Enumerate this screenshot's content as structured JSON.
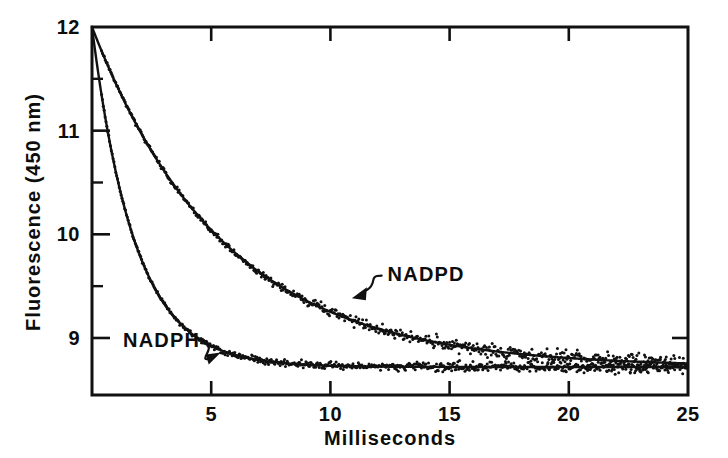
{
  "chart_data": {
    "type": "line",
    "title": "",
    "xlabel": "Milliseconds",
    "ylabel": "Fluorescence  (450 nm)",
    "xlim": [
      0,
      25
    ],
    "ylim": [
      8.45,
      12
    ],
    "grid": false,
    "legend_position": "inline-annotations",
    "x_ticks": [
      5,
      10,
      15,
      20,
      25
    ],
    "x_tick_labels": [
      "5",
      "10",
      "15",
      "20",
      "25"
    ],
    "x_minor_ticks": [],
    "y_ticks": [
      9,
      10,
      11,
      12
    ],
    "y_tick_labels": [
      "9",
      "10",
      "11",
      "12"
    ],
    "y_minor_ticks": [
      9.5,
      10.5,
      11.5
    ],
    "baseline": 8.72,
    "series": [
      {
        "name": "NADPD",
        "label": "NADPD",
        "model": "exponential decay",
        "amplitude": 3.28,
        "tau_ms": 5.5,
        "offset": 8.72,
        "x": [
          0,
          0.5,
          1,
          1.5,
          2,
          2.5,
          3,
          3.5,
          4,
          4.5,
          5,
          5.5,
          6,
          6.5,
          7,
          7.5,
          8,
          8.5,
          9,
          9.5,
          10,
          10.5,
          11,
          11.5,
          12,
          12.5,
          13,
          13.5,
          14,
          14.5,
          15,
          15.5,
          16,
          16.5,
          17,
          17.5,
          18,
          18.5,
          19,
          19.5,
          20,
          20.5,
          21,
          21.5,
          22,
          22.5,
          23,
          23.5,
          24,
          24.5,
          25
        ],
        "values": [
          12.0,
          11.72,
          11.46,
          11.22,
          10.99,
          10.78,
          10.58,
          10.4,
          10.22,
          10.06,
          9.91,
          9.77,
          9.64,
          9.52,
          9.41,
          9.3,
          9.21,
          9.12,
          9.03,
          8.96,
          8.89,
          8.82,
          8.76,
          8.71,
          8.66,
          8.61,
          8.57,
          8.53,
          8.49,
          8.46,
          8.43,
          8.4,
          8.38,
          8.35,
          8.33,
          8.31,
          8.3,
          8.28,
          8.27,
          8.25,
          8.24,
          8.23,
          8.22,
          8.21,
          8.2,
          8.2,
          8.19,
          8.18,
          8.18,
          8.17,
          8.17
        ],
        "value_at_25ms": 8.85
      },
      {
        "name": "NADPH",
        "label": "NADPH",
        "model": "exponential decay",
        "amplitude": 3.28,
        "tau_ms": 1.8,
        "offset": 8.72,
        "x": [
          0,
          0.5,
          1,
          1.5,
          2,
          2.5,
          3,
          3.5,
          4,
          4.5,
          5,
          5.5,
          6,
          6.5,
          7,
          7.5,
          8,
          8.5,
          9,
          9.5,
          10,
          11,
          12,
          13,
          14,
          15,
          16,
          17,
          18,
          19,
          20,
          21,
          22,
          23,
          24,
          25
        ],
        "values": [
          12.0,
          11.22,
          10.62,
          10.16,
          9.8,
          9.52,
          9.3,
          9.13,
          9.0,
          8.9,
          8.82,
          8.76,
          8.71,
          8.67,
          8.64,
          8.62,
          8.6,
          8.58,
          8.57,
          8.56,
          8.55,
          8.54,
          8.53,
          8.53,
          8.72,
          8.72,
          8.72,
          8.72,
          8.72,
          8.72,
          8.72,
          8.72,
          8.72,
          8.72,
          8.72,
          8.72
        ],
        "value_at_25ms": 8.72
      }
    ],
    "annotations": [
      {
        "text": "NADPD",
        "points_to_series": "NADPD",
        "arrow_direction": "down-left",
        "label_x_ms": 12.4,
        "label_y": 9.62,
        "target_x_ms": 10.9,
        "target_y": 9.48
      },
      {
        "text": "NADPH",
        "points_to_series": "NADPH",
        "arrow_direction": "up-right",
        "label_x_ms": 1.3,
        "label_y": 8.98,
        "target_x_ms": 5.4,
        "target_y": 8.87
      }
    ]
  },
  "colors": {
    "ink": "#111111",
    "background": "#ffffff"
  }
}
